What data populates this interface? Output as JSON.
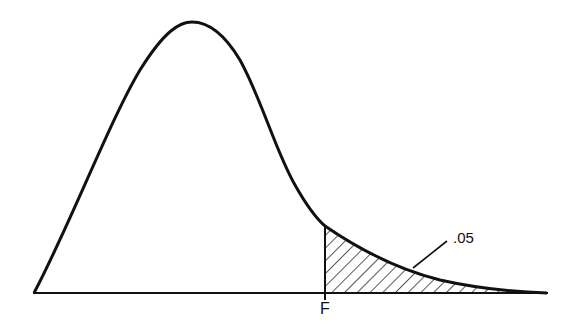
{
  "diagram": {
    "title": "",
    "type": "F-distribution density curve with shaded right tail",
    "critical_value_label": "F",
    "tail_area_label": ".05",
    "colors": {
      "line": "#111111",
      "background": "#ffffff",
      "hatch": "#111111"
    }
  }
}
